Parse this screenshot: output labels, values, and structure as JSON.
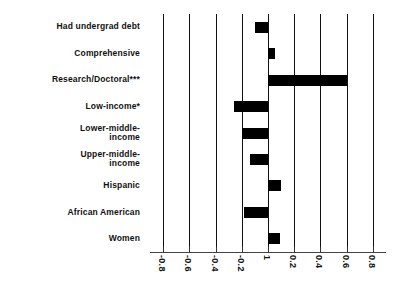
{
  "chart_data": {
    "type": "bar",
    "orientation": "horizontal",
    "title": "",
    "xlabel": "",
    "ylabel": "",
    "categories": [
      "Had undergrad debt",
      "Comprehensive",
      "Research/Doctoral***",
      "Low-income*",
      "Lower-middle-\nincome",
      "Upper-middle-\nincome",
      "Hispanic",
      "African American",
      "Women"
    ],
    "values": [
      -0.1,
      0.05,
      0.6,
      -0.26,
      -0.2,
      -0.14,
      0.1,
      -0.18,
      0.09
    ],
    "xlim": [
      -0.9,
      0.9
    ],
    "xticks": [
      -0.8,
      -0.6,
      -0.4,
      -0.2,
      0,
      0.2,
      0.4,
      0.6,
      0.8
    ],
    "xticklabels": [
      "-0.8",
      "-0.6",
      "-0.4",
      "-0.2",
      "1",
      "0.2",
      "0.4",
      "0.6",
      "0.8"
    ],
    "grid": true,
    "legend": false,
    "bar_color": "#000000",
    "gridline_color": "#111111",
    "axis_color": "#444444"
  }
}
